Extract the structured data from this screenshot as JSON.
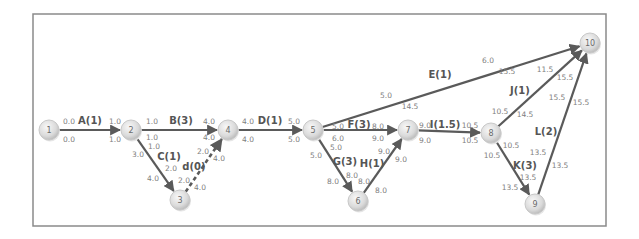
{
  "diagram": {
    "type": "activity-on-arrow network",
    "frame": {
      "x": 33,
      "y": 14,
      "width": 573,
      "height": 212
    },
    "colors": {
      "edge": "#5a5a5a",
      "node_fill_center": "#f4f4f4",
      "node_fill_edge": "#c4c4c4",
      "label": "#555555",
      "time": "#808080",
      "frame": "#8a8a8a"
    },
    "nodes": [
      {
        "id": "1",
        "label": "1",
        "x": 49,
        "y": 130
      },
      {
        "id": "2",
        "label": "2",
        "x": 131,
        "y": 130
      },
      {
        "id": "3",
        "label": "3",
        "x": 180,
        "y": 200
      },
      {
        "id": "4",
        "label": "4",
        "x": 228,
        "y": 130
      },
      {
        "id": "5",
        "label": "5",
        "x": 313,
        "y": 130
      },
      {
        "id": "6",
        "label": "6",
        "x": 358,
        "y": 201
      },
      {
        "id": "7",
        "label": "7",
        "x": 408,
        "y": 130
      },
      {
        "id": "8",
        "label": "8",
        "x": 491,
        "y": 133
      },
      {
        "id": "9",
        "label": "9",
        "x": 535,
        "y": 204
      },
      {
        "id": "10",
        "label": "10",
        "x": 590,
        "y": 43
      }
    ],
    "activities": [
      {
        "name": "A",
        "label": "A(1)",
        "duration": 1,
        "from": "1",
        "to": "2",
        "dummy": false,
        "label_pos": [
          90,
          120
        ],
        "times": [
          {
            "text": "0.0",
            "x": 69,
            "y": 121
          },
          {
            "text": "0.0",
            "x": 69,
            "y": 139
          },
          {
            "text": "1.0",
            "x": 115,
            "y": 121
          },
          {
            "text": "1.0",
            "x": 115,
            "y": 139
          }
        ]
      },
      {
        "name": "B",
        "label": "B(3)",
        "duration": 3,
        "from": "2",
        "to": "4",
        "dummy": false,
        "label_pos": [
          181,
          120
        ],
        "times": [
          {
            "text": "1.0",
            "x": 152,
            "y": 121
          },
          {
            "text": "1.0",
            "x": 152,
            "y": 137
          },
          {
            "text": "4.0",
            "x": 209,
            "y": 121
          },
          {
            "text": "4.0",
            "x": 209,
            "y": 137
          }
        ]
      },
      {
        "name": "C",
        "label": "C(1)",
        "duration": 1,
        "from": "2",
        "to": "3",
        "dummy": false,
        "label_pos": [
          169,
          156
        ],
        "times": [
          {
            "text": "1.0",
            "x": 154,
            "y": 146
          },
          {
            "text": "3.0",
            "x": 138,
            "y": 154
          },
          {
            "text": "2.0",
            "x": 171,
            "y": 168
          },
          {
            "text": "4.0",
            "x": 153,
            "y": 178
          }
        ]
      },
      {
        "name": "d",
        "label": "d(0)",
        "duration": 0,
        "from": "3",
        "to": "4",
        "dummy": true,
        "label_pos": [
          194,
          166
        ],
        "times": [
          {
            "text": "2.0",
            "x": 203,
            "y": 151
          },
          {
            "text": "4.0",
            "x": 219,
            "y": 158
          },
          {
            "text": "2.0",
            "x": 184,
            "y": 180
          },
          {
            "text": "4.0",
            "x": 200,
            "y": 187
          }
        ]
      },
      {
        "name": "D",
        "label": "D(1)",
        "duration": 1,
        "from": "4",
        "to": "5",
        "dummy": false,
        "label_pos": [
          270,
          120
        ],
        "times": [
          {
            "text": "4.0",
            "x": 248,
            "y": 121
          },
          {
            "text": "4.0",
            "x": 248,
            "y": 139
          },
          {
            "text": "5.0",
            "x": 294,
            "y": 121
          },
          {
            "text": "5.0",
            "x": 294,
            "y": 139
          }
        ]
      },
      {
        "name": "E",
        "label": "E(1)",
        "duration": 1,
        "from": "5",
        "to": "10",
        "dummy": false,
        "label_pos": [
          440,
          74
        ],
        "times": [
          {
            "text": "5.0",
            "x": 386,
            "y": 95
          },
          {
            "text": "14.5",
            "x": 410,
            "y": 106
          },
          {
            "text": "6.0",
            "x": 488,
            "y": 60
          },
          {
            "text": "15.5",
            "x": 507,
            "y": 71
          }
        ]
      },
      {
        "name": "F",
        "label": "F(3)",
        "duration": 3,
        "from": "5",
        "to": "7",
        "dummy": false,
        "label_pos": [
          359,
          124
        ],
        "times": [
          {
            "text": "5.0",
            "x": 338,
            "y": 126
          },
          {
            "text": "6.0",
            "x": 338,
            "y": 138
          },
          {
            "text": "8.0",
            "x": 378,
            "y": 126
          },
          {
            "text": "9.0",
            "x": 378,
            "y": 138
          }
        ]
      },
      {
        "name": "G",
        "label": "G(3)",
        "duration": 3,
        "from": "5",
        "to": "6",
        "dummy": false,
        "label_pos": [
          345,
          161
        ],
        "times": [
          {
            "text": "5.0",
            "x": 336,
            "y": 147
          },
          {
            "text": "5.0",
            "x": 316,
            "y": 155
          },
          {
            "text": "8.0",
            "x": 352,
            "y": 175
          },
          {
            "text": "8.0",
            "x": 333,
            "y": 181
          }
        ]
      },
      {
        "name": "H",
        "label": "H(1)",
        "duration": 1,
        "from": "6",
        "to": "7",
        "dummy": false,
        "label_pos": [
          372,
          163
        ],
        "times": [
          {
            "text": "8.0",
            "x": 364,
            "y": 181
          },
          {
            "text": "8.0",
            "x": 381,
            "y": 190
          },
          {
            "text": "9.0",
            "x": 384,
            "y": 151
          },
          {
            "text": "9.0",
            "x": 401,
            "y": 159
          }
        ]
      },
      {
        "name": "I",
        "label": "I(1.5)",
        "duration": 1.5,
        "from": "7",
        "to": "8",
        "dummy": false,
        "label_pos": [
          445,
          124
        ],
        "times": [
          {
            "text": "9.0",
            "x": 425,
            "y": 125
          },
          {
            "text": "9.0",
            "x": 425,
            "y": 140
          },
          {
            "text": "10.5",
            "x": 470,
            "y": 125
          },
          {
            "text": "10.5",
            "x": 470,
            "y": 140
          }
        ]
      },
      {
        "name": "J",
        "label": "J(1)",
        "duration": 1,
        "from": "8",
        "to": "10",
        "dummy": false,
        "label_pos": [
          520,
          90
        ],
        "times": [
          {
            "text": "10.5",
            "x": 500,
            "y": 111
          },
          {
            "text": "14.5",
            "x": 525,
            "y": 114
          },
          {
            "text": "11.5",
            "x": 545,
            "y": 69
          },
          {
            "text": "15.5",
            "x": 565,
            "y": 77
          }
        ]
      },
      {
        "name": "K",
        "label": "K(3)",
        "duration": 3,
        "from": "8",
        "to": "9",
        "dummy": false,
        "label_pos": [
          525,
          165
        ],
        "times": [
          {
            "text": "10.5",
            "x": 511,
            "y": 145
          },
          {
            "text": "10.5",
            "x": 492,
            "y": 155
          },
          {
            "text": "13.5",
            "x": 528,
            "y": 177
          },
          {
            "text": "13.5",
            "x": 510,
            "y": 187
          }
        ]
      },
      {
        "name": "L",
        "label": "L(2)",
        "duration": 2,
        "from": "9",
        "to": "10",
        "dummy": false,
        "label_pos": [
          546,
          131
        ],
        "times": [
          {
            "text": "13.5",
            "x": 538,
            "y": 152
          },
          {
            "text": "13.5",
            "x": 560,
            "y": 165
          },
          {
            "text": "15.5",
            "x": 557,
            "y": 97
          },
          {
            "text": "15.5",
            "x": 581,
            "y": 102
          }
        ]
      }
    ]
  }
}
